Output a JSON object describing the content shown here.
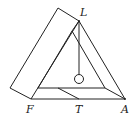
{
  "diagram": {
    "labels": {
      "L": "L",
      "F": "F",
      "T": "T",
      "A": "A"
    },
    "colors": {
      "stroke": "#222222",
      "background": "#ffffff"
    }
  }
}
